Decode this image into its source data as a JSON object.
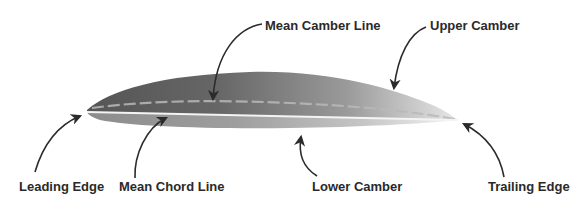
{
  "diagram": {
    "colors": {
      "upper_surface_dark": "#5e5e5e",
      "upper_surface_light": "#e6e6e6",
      "lower_surface_dark": "#8a8a8a",
      "lower_surface_light": "#f2f2f2",
      "chord_line": "#f4f4f4",
      "camber_dash": "#b9b9b9",
      "arrow": "#2b2b2b",
      "label_text": "#2a2a2a"
    },
    "labels": {
      "mean_camber_line": "Mean Camber Line",
      "upper_camber": "Upper Camber",
      "leading_edge": "Leading Edge",
      "mean_chord_line": "Mean Chord Line",
      "lower_camber": "Lower Camber",
      "trailing_edge": "Trailing Edge"
    }
  }
}
